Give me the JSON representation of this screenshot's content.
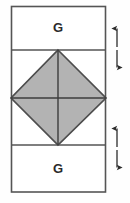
{
  "figure": {
    "background_color": "#fefefe",
    "title": "",
    "outline_color": "#555555",
    "divider_color": "#555555",
    "shape_fill_color": "#b3b3b3",
    "shape_edge_color": "#4d4d4d",
    "arrow_color": "#2b2b2b",
    "rectangle": {
      "left": 11,
      "top": 6,
      "right": 106,
      "bottom": 192
    },
    "dividers": [
      {
        "name": "upper-divider",
        "y": 50
      },
      {
        "name": "lower-divider",
        "y": 145
      }
    ],
    "bands": [
      {
        "name": "top-band",
        "label": "G",
        "label_x": 58,
        "label_y": 28
      },
      {
        "name": "middle-band",
        "label": "",
        "label_x": 58,
        "label_y": 98
      },
      {
        "name": "bottom-band",
        "label": "G",
        "label_x": 58,
        "label_y": 169
      }
    ],
    "diamond": {
      "name": "shaded-rhombus",
      "top_vertex": {
        "x": 58,
        "y": 50
      },
      "right_vertex": {
        "x": 106,
        "y": 98
      },
      "bottom_vertex": {
        "x": 58,
        "y": 145
      },
      "left_vertex": {
        "x": 11,
        "y": 98
      },
      "center_lines": [
        {
          "name": "vertical-centerline",
          "x1": 58,
          "y1": 50,
          "x2": 58,
          "y2": 145
        },
        {
          "name": "horizontal-centerline",
          "x1": 11,
          "y1": 98,
          "x2": 106,
          "y2": 98
        }
      ]
    },
    "dimension_arrows": [
      {
        "name": "upper-dimension-arrow",
        "x": 117,
        "y_top": 28,
        "y_bottom": 68,
        "label": "",
        "double_headed": true
      },
      {
        "name": "lower-dimension-arrow",
        "x": 117,
        "y_top": 128,
        "y_bottom": 168,
        "label": "",
        "double_headed": true
      }
    ]
  }
}
